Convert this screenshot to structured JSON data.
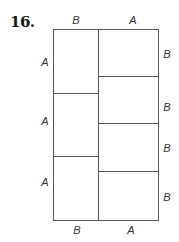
{
  "problem": {
    "number": "16."
  },
  "figure": {
    "line_color": "#555555",
    "top_labels": [
      "B",
      "A"
    ],
    "bottom_labels": [
      "B",
      "A"
    ],
    "left_labels": [
      "A",
      "A",
      "A"
    ],
    "right_labels": [
      "B",
      "B",
      "B",
      "B"
    ],
    "left_column_rectangles": 3,
    "right_column_rectangles": 4
  }
}
